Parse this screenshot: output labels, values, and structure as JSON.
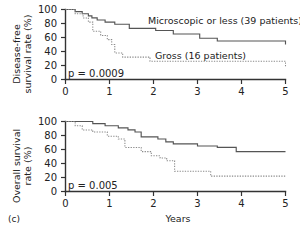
{
  "figure": {
    "panel_label": "(c)",
    "xlabel": "Years"
  },
  "chart_data": [
    {
      "type": "line",
      "subtype": "kaplan-meier-step",
      "title": "",
      "xlabel": "",
      "ylabel": "Disease-free survival rate (%)",
      "ylabel_line1": "Disease-free",
      "ylabel_line2": "survival rate (%)",
      "xlim": [
        0,
        5
      ],
      "ylim": [
        0,
        100
      ],
      "xticks": [
        0,
        1,
        2,
        3,
        4,
        5
      ],
      "xticklabels": [
        "0",
        "1",
        "2",
        "3",
        "4",
        "5"
      ],
      "yticks": [
        0,
        20,
        40,
        60,
        80,
        100
      ],
      "yticklabels": [
        "0",
        "20",
        "40",
        "60",
        "80",
        "100"
      ],
      "grid": false,
      "legend_position": "inline-annotation",
      "annotations": [
        {
          "text": "p = 0.0009",
          "x": 0.12,
          "y": 12,
          "name": "p-value"
        }
      ],
      "series": [
        {
          "name": "Microscopic or less (39 patients)",
          "style": "solid",
          "color": "#555555",
          "label_x": 2.05,
          "label_y": 80,
          "points": [
            [
              0.0,
              100
            ],
            [
              0.22,
              100
            ],
            [
              0.22,
              97
            ],
            [
              0.38,
              97
            ],
            [
              0.38,
              94
            ],
            [
              0.52,
              94
            ],
            [
              0.52,
              91
            ],
            [
              0.6,
              91
            ],
            [
              0.6,
              88
            ],
            [
              0.72,
              88
            ],
            [
              0.72,
              85
            ],
            [
              0.9,
              85
            ],
            [
              0.9,
              82
            ],
            [
              1.12,
              82
            ],
            [
              1.12,
              79
            ],
            [
              1.45,
              79
            ],
            [
              1.45,
              73
            ],
            [
              2.05,
              73
            ],
            [
              2.05,
              70
            ],
            [
              2.45,
              70
            ],
            [
              2.45,
              65
            ],
            [
              3.05,
              65
            ],
            [
              3.05,
              59
            ],
            [
              3.45,
              59
            ],
            [
              3.45,
              55
            ],
            [
              5.0,
              55
            ],
            [
              5.0,
              50
            ]
          ]
        },
        {
          "name": "Gross (16 patients)",
          "style": "dotted",
          "color": "#8a8a8a",
          "label_x": 2.35,
          "label_y": 38,
          "points": [
            [
              0.0,
              100
            ],
            [
              0.22,
              100
            ],
            [
              0.22,
              94
            ],
            [
              0.4,
              94
            ],
            [
              0.4,
              88
            ],
            [
              0.52,
              88
            ],
            [
              0.52,
              82
            ],
            [
              0.62,
              82
            ],
            [
              0.62,
              69
            ],
            [
              0.8,
              69
            ],
            [
              0.8,
              63
            ],
            [
              0.95,
              63
            ],
            [
              0.95,
              57
            ],
            [
              1.05,
              57
            ],
            [
              1.05,
              50
            ],
            [
              1.12,
              50
            ],
            [
              1.12,
              38
            ],
            [
              1.3,
              38
            ],
            [
              1.3,
              32
            ],
            [
              1.92,
              32
            ],
            [
              1.92,
              26
            ],
            [
              5.0,
              26
            ],
            [
              5.0,
              19
            ]
          ]
        }
      ]
    },
    {
      "type": "line",
      "subtype": "kaplan-meier-step",
      "title": "",
      "xlabel": "Years",
      "ylabel": "Overall survival rate (%)",
      "ylabel_line1": "Overall survival",
      "ylabel_line2": "rate (%)",
      "xlim": [
        0,
        5
      ],
      "ylim": [
        0,
        100
      ],
      "xticks": [
        0,
        1,
        2,
        3,
        4,
        5
      ],
      "xticklabels": [
        "0",
        "1",
        "2",
        "3",
        "4",
        "5"
      ],
      "yticks": [
        0,
        20,
        40,
        60,
        80,
        100
      ],
      "yticklabels": [
        "0",
        "20",
        "40",
        "60",
        "80",
        "100"
      ],
      "grid": false,
      "legend_position": "none",
      "annotations": [
        {
          "text": "p = 0.005",
          "x": 0.12,
          "y": 12,
          "name": "p-value"
        }
      ],
      "series": [
        {
          "name": "Microscopic or less (39 patients)",
          "style": "solid",
          "color": "#555555",
          "points": [
            [
              0.0,
              100
            ],
            [
              0.62,
              100
            ],
            [
              0.62,
              97
            ],
            [
              0.9,
              97
            ],
            [
              0.9,
              94
            ],
            [
              1.2,
              94
            ],
            [
              1.2,
              91
            ],
            [
              1.42,
              91
            ],
            [
              1.42,
              88
            ],
            [
              1.58,
              88
            ],
            [
              1.58,
              85
            ],
            [
              1.72,
              85
            ],
            [
              1.72,
              78
            ],
            [
              2.1,
              78
            ],
            [
              2.1,
              75
            ],
            [
              2.28,
              75
            ],
            [
              2.28,
              71
            ],
            [
              2.45,
              71
            ],
            [
              2.45,
              68
            ],
            [
              3.0,
              68
            ],
            [
              3.0,
              65
            ],
            [
              3.45,
              65
            ],
            [
              3.45,
              63
            ],
            [
              3.88,
              63
            ],
            [
              3.88,
              57
            ],
            [
              5.0,
              57
            ]
          ]
        },
        {
          "name": "Gross (16 patients)",
          "style": "dotted",
          "color": "#8a8a8a",
          "points": [
            [
              0.0,
              100
            ],
            [
              0.22,
              100
            ],
            [
              0.22,
              94
            ],
            [
              0.38,
              94
            ],
            [
              0.38,
              88
            ],
            [
              0.62,
              88
            ],
            [
              0.62,
              85
            ],
            [
              0.95,
              85
            ],
            [
              0.95,
              79
            ],
            [
              1.2,
              79
            ],
            [
              1.2,
              75
            ],
            [
              1.35,
              75
            ],
            [
              1.35,
              63
            ],
            [
              1.72,
              63
            ],
            [
              1.72,
              57
            ],
            [
              1.95,
              57
            ],
            [
              1.95,
              51
            ],
            [
              2.15,
              51
            ],
            [
              2.15,
              48
            ],
            [
              2.3,
              48
            ],
            [
              2.3,
              44
            ],
            [
              2.48,
              44
            ],
            [
              2.48,
              29
            ],
            [
              2.62,
              29
            ],
            [
              2.62,
              29
            ],
            [
              3.3,
              29
            ],
            [
              3.3,
              22
            ],
            [
              5.0,
              22
            ]
          ]
        }
      ]
    }
  ]
}
